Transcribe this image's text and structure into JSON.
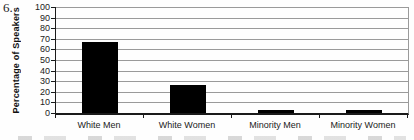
{
  "page": {
    "item_number": "6."
  },
  "chart_data": {
    "type": "bar",
    "title": "",
    "categories": [
      "White Men",
      "White Women",
      "Minority Men",
      "Minority Women"
    ],
    "values": [
      67,
      26,
      3,
      2.5
    ],
    "xlabel": "",
    "ylabel": "Percentage of Speakers",
    "ylim": [
      0,
      100
    ],
    "yticks": [
      0,
      10,
      20,
      30,
      40,
      50,
      60,
      70,
      80,
      90,
      100
    ],
    "grid": true,
    "legend": "none",
    "bar_color": "#000000",
    "gridline_color": "#9a9a9a",
    "axis_color": "#1a1a1a"
  }
}
